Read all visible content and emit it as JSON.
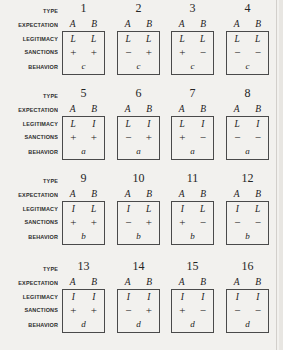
{
  "figure": {
    "row_labels": {
      "type": "TYPE",
      "expectation": "EXPECTATION",
      "legitimacy": "LEGITIMACY",
      "sanctions": "SANCTIONS",
      "behavior": "BEHAVIOR"
    },
    "column_headers": [
      "A",
      "B"
    ],
    "blocks": [
      {
        "cells": [
          {
            "type": "1",
            "expectation": [
              "A",
              "B"
            ],
            "legitimacy": [
              "L",
              "L"
            ],
            "sanctions": [
              "+",
              "+"
            ],
            "behavior": "c"
          },
          {
            "type": "2",
            "expectation": [
              "A",
              "B"
            ],
            "legitimacy": [
              "L",
              "L"
            ],
            "sanctions": [
              "−",
              "+"
            ],
            "behavior": "c"
          },
          {
            "type": "3",
            "expectation": [
              "A",
              "B"
            ],
            "legitimacy": [
              "L",
              "L"
            ],
            "sanctions": [
              "+",
              "−"
            ],
            "behavior": "c"
          },
          {
            "type": "4",
            "expectation": [
              "A",
              "B"
            ],
            "legitimacy": [
              "L",
              "L"
            ],
            "sanctions": [
              "−",
              "−"
            ],
            "behavior": "c"
          }
        ]
      },
      {
        "cells": [
          {
            "type": "5",
            "expectation": [
              "A",
              "B"
            ],
            "legitimacy": [
              "L",
              "I"
            ],
            "sanctions": [
              "+",
              "+"
            ],
            "behavior": "a"
          },
          {
            "type": "6",
            "expectation": [
              "A",
              "B"
            ],
            "legitimacy": [
              "L",
              "I"
            ],
            "sanctions": [
              "−",
              "+"
            ],
            "behavior": "a"
          },
          {
            "type": "7",
            "expectation": [
              "A",
              "B"
            ],
            "legitimacy": [
              "L",
              "I"
            ],
            "sanctions": [
              "+",
              "−"
            ],
            "behavior": "a"
          },
          {
            "type": "8",
            "expectation": [
              "A",
              "B"
            ],
            "legitimacy": [
              "L",
              "I"
            ],
            "sanctions": [
              "−",
              "−"
            ],
            "behavior": "a"
          }
        ]
      },
      {
        "cells": [
          {
            "type": "9",
            "expectation": [
              "A",
              "B"
            ],
            "legitimacy": [
              "I",
              "L"
            ],
            "sanctions": [
              "+",
              "+"
            ],
            "behavior": "b"
          },
          {
            "type": "10",
            "expectation": [
              "A",
              "B"
            ],
            "legitimacy": [
              "I",
              "L"
            ],
            "sanctions": [
              "−",
              "+"
            ],
            "behavior": "b"
          },
          {
            "type": "11",
            "expectation": [
              "A",
              "B"
            ],
            "legitimacy": [
              "I",
              "L"
            ],
            "sanctions": [
              "+",
              "−"
            ],
            "behavior": "b"
          },
          {
            "type": "12",
            "expectation": [
              "A",
              "B"
            ],
            "legitimacy": [
              "I",
              "L"
            ],
            "sanctions": [
              "−",
              "−"
            ],
            "behavior": "b"
          }
        ]
      },
      {
        "cells": [
          {
            "type": "13",
            "expectation": [
              "A",
              "B"
            ],
            "legitimacy": [
              "I",
              "I"
            ],
            "sanctions": [
              "+",
              "+"
            ],
            "behavior": "d"
          },
          {
            "type": "14",
            "expectation": [
              "A",
              "B"
            ],
            "legitimacy": [
              "I",
              "I"
            ],
            "sanctions": [
              "−",
              "+"
            ],
            "behavior": "d"
          },
          {
            "type": "15",
            "expectation": [
              "A",
              "B"
            ],
            "legitimacy": [
              "I",
              "I"
            ],
            "sanctions": [
              "+",
              "−"
            ],
            "behavior": "d"
          },
          {
            "type": "16",
            "expectation": [
              "A",
              "B"
            ],
            "legitimacy": [
              "I",
              "I"
            ],
            "sanctions": [
              "−",
              "−"
            ],
            "behavior": "d"
          }
        ]
      }
    ]
  },
  "layout": {
    "block_top": [
      0,
      85,
      170,
      258
    ],
    "cell_left": [
      62,
      117,
      171,
      226
    ]
  }
}
